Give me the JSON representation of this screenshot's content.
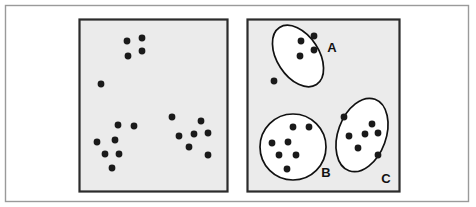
{
  "figure": {
    "background_color": "#ffffff",
    "outer_border_color": "#9a9a9a",
    "panel_fill_color": "#ebebeb",
    "panel_border_color": "#2b2b2b",
    "dot_color": "#1a1a1a",
    "dot_radius": 3.4,
    "outline_color": "#111111"
  },
  "outer_frame": {
    "x": 5,
    "y": 5,
    "width": 463,
    "height": 196
  },
  "panels": [
    {
      "name": "unclustered-panel",
      "label": "",
      "x": 79,
      "y": 19,
      "width": 148,
      "height": 172,
      "points": [
        {
          "x": 127,
          "y": 41
        },
        {
          "x": 142,
          "y": 38
        },
        {
          "x": 142,
          "y": 51
        },
        {
          "x": 128,
          "y": 56
        },
        {
          "x": 101,
          "y": 84
        },
        {
          "x": 118,
          "y": 125
        },
        {
          "x": 134,
          "y": 126
        },
        {
          "x": 97,
          "y": 142
        },
        {
          "x": 115,
          "y": 140
        },
        {
          "x": 105,
          "y": 154
        },
        {
          "x": 119,
          "y": 154
        },
        {
          "x": 112,
          "y": 168
        },
        {
          "x": 172,
          "y": 117
        },
        {
          "x": 201,
          "y": 121
        },
        {
          "x": 179,
          "y": 136
        },
        {
          "x": 194,
          "y": 134
        },
        {
          "x": 208,
          "y": 133
        },
        {
          "x": 189,
          "y": 147
        },
        {
          "x": 208,
          "y": 155
        }
      ],
      "clusters": []
    },
    {
      "name": "clustered-panel",
      "label": "",
      "x": 247,
      "y": 19,
      "width": 152,
      "height": 172,
      "points": [],
      "clusters": [
        {
          "id": "cluster-a",
          "label": "A",
          "shape": "ellipse",
          "cx": 298,
          "cy": 56,
          "rx": 21,
          "ry": 34,
          "rotation": -33,
          "label_x": 332,
          "label_y": 52,
          "points": [
            {
              "x": 301,
              "y": 41
            },
            {
              "x": 314,
              "y": 36
            },
            {
              "x": 314,
              "y": 50
            },
            {
              "x": 300,
              "y": 56
            },
            {
              "x": 274,
              "y": 81
            }
          ]
        },
        {
          "id": "cluster-b",
          "label": "B",
          "shape": "circle",
          "cx": 293,
          "cy": 147,
          "rx": 33,
          "ry": 33,
          "rotation": 0,
          "label_x": 326,
          "label_y": 177,
          "points": [
            {
              "x": 293,
              "y": 127
            },
            {
              "x": 309,
              "y": 127
            },
            {
              "x": 272,
              "y": 143
            },
            {
              "x": 288,
              "y": 142
            },
            {
              "x": 279,
              "y": 155
            },
            {
              "x": 296,
              "y": 155
            },
            {
              "x": 287,
              "y": 169
            }
          ]
        },
        {
          "id": "cluster-c",
          "label": "C",
          "shape": "ellipse",
          "cx": 362,
          "cy": 135,
          "rx": 24,
          "ry": 38,
          "rotation": 20,
          "label_x": 386,
          "label_y": 183,
          "points": [
            {
              "x": 344,
              "y": 117
            },
            {
              "x": 372,
              "y": 124
            },
            {
              "x": 349,
              "y": 136
            },
            {
              "x": 365,
              "y": 134
            },
            {
              "x": 378,
              "y": 133
            },
            {
              "x": 358,
              "y": 148
            },
            {
              "x": 378,
              "y": 155
            }
          ]
        }
      ]
    }
  ]
}
